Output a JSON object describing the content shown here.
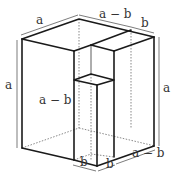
{
  "diagram": {
    "labels": {
      "top_left": "a",
      "top_middle": "a − b",
      "top_right": "b",
      "left_height": "a",
      "inner_height": "a − b",
      "right_height": "a",
      "bottom_left": "b",
      "bottom_middle": "b",
      "bottom_right": "a − b"
    },
    "colors": {
      "edge": "#1a1a1a",
      "label": "#333333",
      "background": "#ffffff"
    }
  }
}
